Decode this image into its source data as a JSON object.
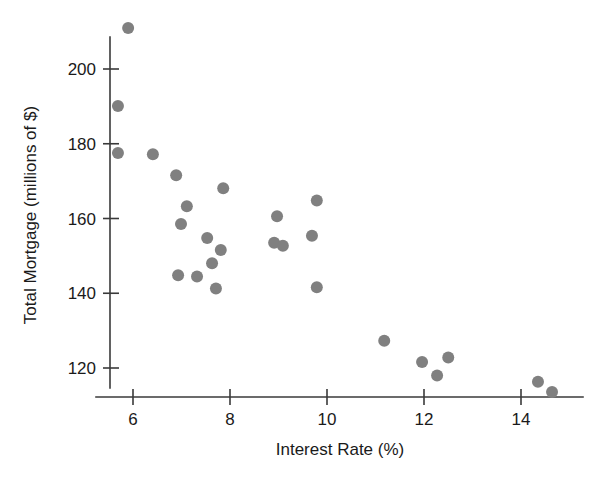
{
  "chart_data": {
    "type": "scatter",
    "title": "",
    "xlabel": "Interest Rate (%)",
    "ylabel": "Total Mortgage (millions of $)",
    "xlim": [
      5.2,
      15.3
    ],
    "ylim": [
      110,
      213
    ],
    "grid": false,
    "legend": null,
    "marker_color": "#808080",
    "marker_shape": "circle",
    "marker_size": 9,
    "xticks": [
      6,
      8,
      10,
      12,
      14
    ],
    "xtick_labels": [
      "6",
      "8",
      "10",
      "12",
      "14"
    ],
    "yticks": [
      120,
      140,
      160,
      180,
      200
    ],
    "ytick_labels": [
      "120",
      "140",
      "160",
      "180",
      "200"
    ],
    "n_points": 26,
    "x": [
      5.9,
      5.69,
      5.69,
      6.41,
      6.89,
      7.11,
      6.99,
      7.86,
      6.93,
      7.32,
      7.53,
      7.63,
      7.81,
      7.71,
      8.97,
      8.91,
      9.09,
      9.79,
      9.69,
      9.79,
      11.18,
      11.96,
      12.5,
      12.27,
      14.35,
      14.64
    ],
    "y": [
      211.0,
      190.1,
      177.5,
      177.2,
      171.6,
      163.3,
      158.5,
      168.1,
      144.8,
      144.5,
      154.8,
      148.0,
      151.6,
      141.3,
      160.6,
      153.5,
      152.7,
      164.8,
      155.4,
      141.6,
      127.3,
      121.6,
      122.8,
      118.0,
      116.3,
      113.6
    ],
    "points": [
      {
        "x": 5.9,
        "y": 211.0
      },
      {
        "x": 5.69,
        "y": 190.1
      },
      {
        "x": 5.69,
        "y": 177.5
      },
      {
        "x": 6.41,
        "y": 177.2
      },
      {
        "x": 6.89,
        "y": 171.6
      },
      {
        "x": 7.11,
        "y": 163.3
      },
      {
        "x": 6.99,
        "y": 158.5
      },
      {
        "x": 7.86,
        "y": 168.1
      },
      {
        "x": 6.93,
        "y": 144.8
      },
      {
        "x": 7.32,
        "y": 144.5
      },
      {
        "x": 7.53,
        "y": 154.8
      },
      {
        "x": 7.63,
        "y": 148.0
      },
      {
        "x": 7.81,
        "y": 151.6
      },
      {
        "x": 7.71,
        "y": 141.3
      },
      {
        "x": 8.97,
        "y": 160.6
      },
      {
        "x": 8.91,
        "y": 153.5
      },
      {
        "x": 9.09,
        "y": 152.7
      },
      {
        "x": 9.79,
        "y": 164.8
      },
      {
        "x": 9.69,
        "y": 155.4
      },
      {
        "x": 9.79,
        "y": 141.6
      },
      {
        "x": 11.18,
        "y": 127.3
      },
      {
        "x": 11.96,
        "y": 121.6
      },
      {
        "x": 12.5,
        "y": 122.8
      },
      {
        "x": 12.27,
        "y": 118.0
      },
      {
        "x": 14.35,
        "y": 116.3
      },
      {
        "x": 14.64,
        "y": 113.6
      }
    ]
  },
  "axes": {
    "x_title": "Interest Rate (%)",
    "y_title": "Total Mortgage (millions of $)"
  }
}
